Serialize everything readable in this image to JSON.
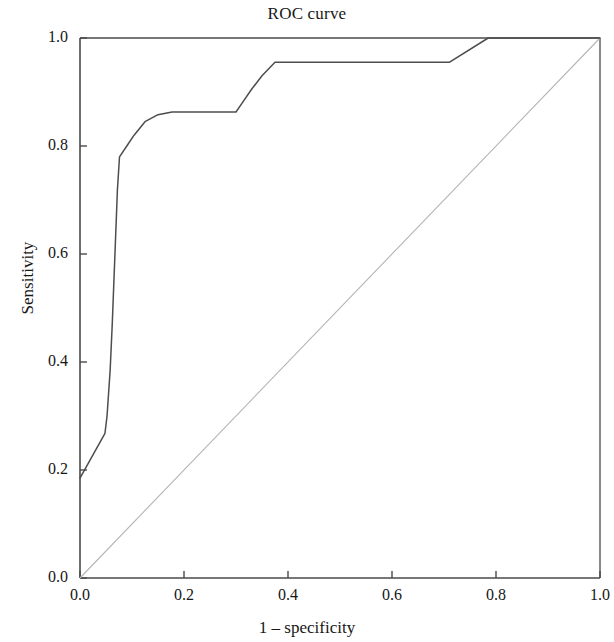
{
  "chart_data": {
    "type": "line",
    "title": "ROC curve",
    "xlabel": "1 – specificity",
    "ylabel": "Sensitivity",
    "xlim": [
      0.0,
      1.0
    ],
    "ylim": [
      0.0,
      1.0
    ],
    "xticks": [
      "0.0",
      "0.2",
      "0.4",
      "0.6",
      "0.8",
      "1.0"
    ],
    "yticks": [
      "0.0",
      "0.2",
      "0.4",
      "0.6",
      "0.8",
      "1.0"
    ],
    "grid": false,
    "legend": null,
    "series": [
      {
        "name": "ROC curve",
        "color": "#4d4d4d",
        "points": [
          [
            0.0,
            0.185
          ],
          [
            0.048,
            0.268
          ],
          [
            0.052,
            0.3
          ],
          [
            0.058,
            0.385
          ],
          [
            0.062,
            0.47
          ],
          [
            0.068,
            0.62
          ],
          [
            0.072,
            0.72
          ],
          [
            0.076,
            0.78
          ],
          [
            0.09,
            0.8
          ],
          [
            0.104,
            0.82
          ],
          [
            0.125,
            0.845
          ],
          [
            0.15,
            0.858
          ],
          [
            0.177,
            0.863
          ],
          [
            0.245,
            0.863
          ],
          [
            0.3,
            0.863
          ],
          [
            0.312,
            0.88
          ],
          [
            0.33,
            0.905
          ],
          [
            0.35,
            0.93
          ],
          [
            0.375,
            0.955
          ],
          [
            0.5,
            0.955
          ],
          [
            0.62,
            0.955
          ],
          [
            0.71,
            0.955
          ],
          [
            0.785,
            1.0
          ],
          [
            1.0,
            1.0
          ]
        ]
      },
      {
        "name": "reference diagonal",
        "color": "#b4b4b4",
        "points": [
          [
            0.0,
            0.0
          ],
          [
            1.0,
            1.0
          ]
        ]
      }
    ]
  },
  "chart": {
    "title": "ROC curve",
    "xlabel": "1 – specificity",
    "ylabel": "Sensitivity",
    "xticks": [
      "0.0",
      "0.2",
      "0.4",
      "0.6",
      "0.8",
      "1.0"
    ],
    "yticks": [
      "0.0",
      "0.2",
      "0.4",
      "0.6",
      "0.8",
      "1.0"
    ]
  },
  "colors": {
    "axis": "#4a4a4a",
    "curve": "#4d4d4d",
    "diagonal": "#b4b4b4",
    "text": "#171717",
    "background": "#ffffff"
  }
}
